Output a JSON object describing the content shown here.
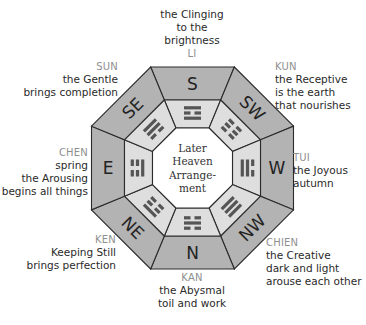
{
  "diagram": {
    "center_label_lines": [
      "Later",
      "Heaven",
      "Arrange-",
      "ment"
    ],
    "colors": {
      "outer_ring": "#b3b3b3",
      "trigram_ring": "#dedede",
      "center": "#ffffff",
      "stroke": "#2b2b2b",
      "trigram_bar": "#555555",
      "name_text": "#8f8f8f",
      "desc_text": "#2a2a2a"
    },
    "sectors": [
      {
        "direction": "S",
        "trigram_name": "LI",
        "lines_outer_to_inner": [
          "solid",
          "broken",
          "solid"
        ]
      },
      {
        "direction": "SW",
        "trigram_name": "KUN",
        "lines_outer_to_inner": [
          "broken",
          "broken",
          "broken"
        ]
      },
      {
        "direction": "W",
        "trigram_name": "TUI",
        "lines_outer_to_inner": [
          "broken",
          "solid",
          "solid"
        ]
      },
      {
        "direction": "NW",
        "trigram_name": "CHIEN",
        "lines_outer_to_inner": [
          "solid",
          "solid",
          "solid"
        ]
      },
      {
        "direction": "N",
        "trigram_name": "KAN",
        "lines_outer_to_inner": [
          "broken",
          "solid",
          "broken"
        ]
      },
      {
        "direction": "NE",
        "trigram_name": "KEN",
        "lines_outer_to_inner": [
          "solid",
          "broken",
          "broken"
        ]
      },
      {
        "direction": "E",
        "trigram_name": "CHEN",
        "lines_outer_to_inner": [
          "broken",
          "broken",
          "solid"
        ]
      },
      {
        "direction": "SE",
        "trigram_name": "SUN",
        "lines_outer_to_inner": [
          "solid",
          "solid",
          "broken"
        ]
      }
    ]
  },
  "labels": {
    "li": {
      "name": "LI",
      "lines": [
        "the Clinging",
        "to the",
        "brightness"
      ]
    },
    "kun": {
      "name": "KUN",
      "lines": [
        "the Receptive",
        "is the earth",
        "that nourishes"
      ]
    },
    "tui": {
      "name": "TUI",
      "lines": [
        "the Joyous",
        "autumn"
      ]
    },
    "chien": {
      "name": "CHIEN",
      "lines": [
        "the Creative",
        "dark and light",
        "arouse each other"
      ]
    },
    "kan": {
      "name": "KAN",
      "lines": [
        "the Abysmal",
        "toil and work"
      ]
    },
    "ken": {
      "name": "KEN",
      "lines": [
        "Keeping Still",
        "brings perfection"
      ]
    },
    "chen": {
      "name": "CHEN",
      "lines": [
        "spring",
        "the Arousing",
        "begins all things"
      ]
    },
    "sun": {
      "name": "SUN",
      "lines": [
        "the Gentle",
        "brings completion"
      ]
    }
  }
}
